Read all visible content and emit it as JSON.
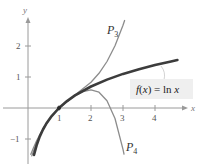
{
  "chart_data": {
    "type": "line",
    "title": "",
    "xlabel": "x",
    "ylabel": "y",
    "xlim": [
      -0.85,
      5.1
    ],
    "ylim": [
      -1.5,
      2.8
    ],
    "grid": false,
    "x_ticks": [
      1,
      2,
      3,
      4
    ],
    "x_tick_labels": [
      "1",
      "2",
      "3",
      "4"
    ],
    "y_ticks": [
      2,
      1,
      -1
    ],
    "y_tick_labels": [
      "2",
      "1",
      "−1"
    ],
    "point_marker": {
      "x": 1,
      "y": 0
    },
    "series": [
      {
        "name": "f(x) = ln x",
        "role": "function",
        "color": "#3c3c3c",
        "x": [
          0.22,
          0.3,
          0.4,
          0.5,
          0.6,
          0.75,
          1,
          1.25,
          1.5,
          2,
          2.5,
          3,
          3.5,
          4,
          4.5,
          4.7
        ],
        "y": [
          -1.514,
          -1.204,
          -0.916,
          -0.693,
          -0.511,
          -0.288,
          0,
          0.223,
          0.405,
          0.693,
          0.916,
          1.099,
          1.253,
          1.386,
          1.504,
          1.548
        ]
      },
      {
        "name": "P3",
        "role": "taylor-polynomial-degree-3",
        "color": "#8c8c8c",
        "x": [
          0.12,
          0.2,
          0.3,
          0.5,
          0.75,
          1,
          1.5,
          2,
          2.25,
          2.5,
          2.75,
          3,
          3.05
        ],
        "y": [
          -1.494,
          -1.291,
          -1.058,
          -0.667,
          -0.287,
          0,
          0.417,
          0.833,
          1.12,
          1.5,
          2.005,
          2.667,
          2.821
        ]
      },
      {
        "name": "P4",
        "role": "taylor-polynomial-degree-4",
        "color": "#8c8c8c",
        "x": [
          0.15,
          0.2,
          0.3,
          0.5,
          0.75,
          1,
          1.5,
          1.75,
          2,
          2.25,
          2.5,
          2.75,
          3,
          3.03
        ],
        "y": [
          -1.546,
          -1.393,
          -1.118,
          -0.682,
          -0.288,
          0,
          0.401,
          0.53,
          0.583,
          0.51,
          0.234,
          -0.34,
          -1.333,
          -1.487
        ]
      }
    ],
    "annotations": [
      {
        "text": "P",
        "sub": "3",
        "target": "P3"
      },
      {
        "text": "P",
        "sub": "4",
        "target": "P4"
      },
      {
        "text": "f(x)  =  ln x",
        "target": "f(x) = ln x"
      }
    ]
  },
  "labels": {
    "x_axis": "x",
    "y_axis": "y",
    "p3_main": "P",
    "p3_sub": "3",
    "p4_main": "P",
    "p4_sub": "4",
    "function": "f(x)  =  ln x",
    "tick_x1": "1",
    "tick_x2": "2",
    "tick_x3": "3",
    "tick_x4": "4",
    "tick_y2": "2",
    "tick_y1": "1",
    "tick_ym1": "−1"
  }
}
